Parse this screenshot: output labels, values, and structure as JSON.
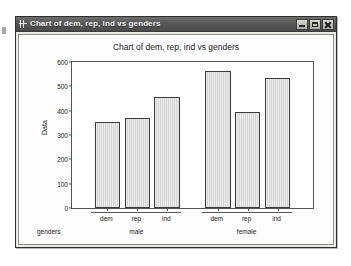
{
  "window": {
    "title": "Chart of dem, rep, ind vs genders",
    "icon": "graph-window-icon",
    "buttons": {
      "minimize": "Minimize",
      "maximize": "Maximize",
      "close": "Close"
    }
  },
  "chart_data": {
    "type": "bar",
    "title": "Chart of dem, rep, ind vs genders",
    "xlabel": "genders",
    "ylabel": "Data",
    "ylim": [
      0,
      600
    ],
    "yticks": [
      0,
      100,
      200,
      300,
      400,
      500,
      600
    ],
    "ytick_labels": [
      "0",
      "100",
      "200",
      "300",
      "400",
      "500",
      "600"
    ],
    "grid": false,
    "legend": null,
    "categories": [
      "dem",
      "rep",
      "ind"
    ],
    "groups": [
      "male",
      "female"
    ],
    "bars": [
      {
        "group": "male",
        "category": "dem",
        "value": 353
      },
      {
        "group": "male",
        "category": "rep",
        "value": 368
      },
      {
        "group": "male",
        "category": "ind",
        "value": 455
      },
      {
        "group": "female",
        "category": "dem",
        "value": 565
      },
      {
        "group": "female",
        "category": "rep",
        "value": 395
      },
      {
        "group": "female",
        "category": "ind",
        "value": 533
      }
    ],
    "series": [
      {
        "name": "male",
        "values": [
          353,
          368,
          455
        ]
      },
      {
        "name": "female",
        "values": [
          565,
          395,
          533
        ]
      }
    ],
    "colors": {
      "bar_fill": "#d5d5d5",
      "bar_border": "#3c3c3c",
      "axis": "#555555",
      "text": "#1a1a1a",
      "plot_background": "#ffffff",
      "window_titlebar": "#585858",
      "window_face": "#e8e8e6"
    }
  }
}
